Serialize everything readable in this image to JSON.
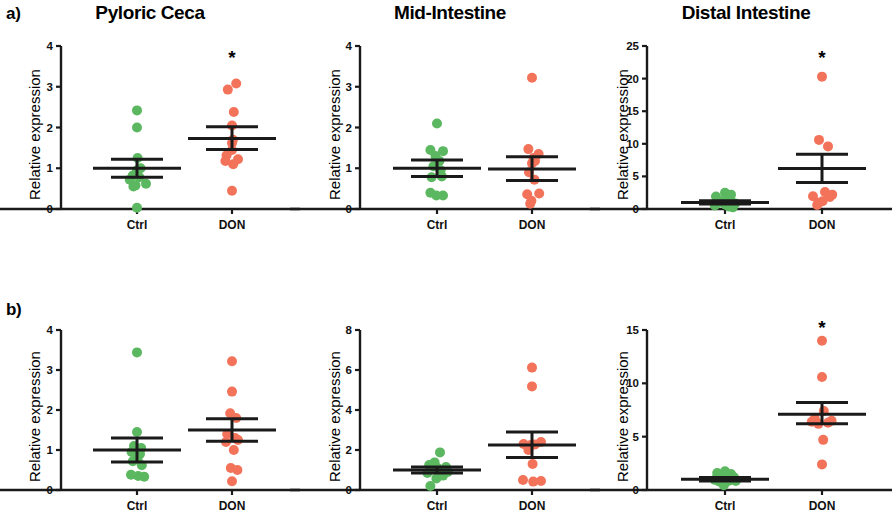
{
  "figure": {
    "width": 892,
    "height": 520,
    "panel_labels": [
      {
        "id": "a",
        "text": "a)"
      },
      {
        "id": "b",
        "text": "b)"
      }
    ],
    "axis_label": "Relative expression",
    "group_labels": [
      "Ctrl",
      "DON"
    ],
    "colors": {
      "ctrl": "#5cb860",
      "don": "#f2735a",
      "axis": "#1a1a1a",
      "text": "#000000"
    },
    "significance_marker": "✱"
  },
  "chart_data": [
    {
      "id": "a-pyloric-ceca",
      "type": "scatter",
      "row": "a",
      "title": "Pyloric Ceca",
      "xlabel": "",
      "ylabel": "Relative expression",
      "ylim": [
        0,
        4
      ],
      "yticks": [
        0,
        1,
        2,
        3,
        4
      ],
      "ytick_labels": [
        "0",
        "1",
        "2",
        "3",
        "4"
      ],
      "grid": false,
      "categories": [
        "Ctrl",
        "DON"
      ],
      "significance": {
        "group": "DON",
        "marker": "*",
        "y": 3.55
      },
      "series": [
        {
          "name": "Ctrl",
          "color": "#5cb860",
          "mean": 1.0,
          "sem_upper": 1.22,
          "sem_lower": 0.78,
          "values": [
            2.42,
            2.0,
            1.25,
            1.0,
            0.95,
            0.82,
            0.78,
            0.72,
            0.62,
            0.58,
            0.55,
            0.03
          ],
          "jitter": [
            0.0,
            0.0,
            0.02,
            0.12,
            0.0,
            -0.14,
            0.08,
            -0.24,
            0.3,
            -0.05,
            -0.12,
            0.0
          ]
        },
        {
          "name": "DON",
          "color": "#f2735a",
          "mean": 1.73,
          "sem_upper": 2.02,
          "sem_lower": 1.46,
          "values": [
            3.08,
            2.93,
            2.38,
            2.05,
            1.7,
            1.62,
            1.45,
            1.32,
            1.22,
            1.18,
            1.1,
            0.45
          ],
          "jitter": [
            0.14,
            -0.14,
            0.06,
            0.0,
            0.03,
            0.0,
            0.0,
            -0.18,
            0.2,
            -0.22,
            0.04,
            0.0
          ]
        }
      ]
    },
    {
      "id": "a-mid-intestine",
      "type": "scatter",
      "row": "a",
      "title": "Mid-Intestine",
      "xlabel": "",
      "ylabel": "Relative expression",
      "ylim": [
        0,
        4
      ],
      "yticks": [
        0,
        1,
        2,
        3,
        4
      ],
      "ytick_labels": [
        "0",
        "1",
        "2",
        "3",
        "4"
      ],
      "grid": false,
      "categories": [
        "Ctrl",
        "DON"
      ],
      "significance": null,
      "series": [
        {
          "name": "Ctrl",
          "color": "#5cb860",
          "mean": 1.0,
          "sem_upper": 1.2,
          "sem_lower": 0.8,
          "values": [
            2.1,
            1.45,
            1.42,
            1.3,
            1.18,
            1.05,
            0.95,
            0.8,
            0.78,
            0.4,
            0.33,
            0.33
          ],
          "jitter": [
            0.0,
            -0.22,
            0.2,
            -0.05,
            0.08,
            -0.12,
            0.12,
            0.16,
            -0.18,
            -0.22,
            -0.02,
            0.2
          ]
        },
        {
          "name": "DON",
          "color": "#f2735a",
          "mean": 0.98,
          "sem_upper": 1.28,
          "sem_lower": 0.7,
          "values": [
            3.22,
            1.47,
            1.35,
            1.25,
            1.18,
            1.12,
            0.9,
            0.72,
            0.38,
            0.36,
            0.2,
            0.13
          ],
          "jitter": [
            0.0,
            -0.12,
            0.22,
            0.05,
            0.1,
            0.0,
            -0.1,
            0.08,
            0.24,
            -0.16,
            -0.02,
            -0.06
          ]
        }
      ]
    },
    {
      "id": "a-distal-intestine",
      "type": "scatter",
      "row": "a",
      "title": "Distal Intestine",
      "xlabel": "",
      "ylabel": "Relative expression",
      "ylim": [
        0,
        25
      ],
      "yticks": [
        0,
        5,
        10,
        15,
        20,
        25
      ],
      "ytick_labels": [
        "0",
        "5",
        "10",
        "15",
        "20",
        "25"
      ],
      "grid": false,
      "categories": [
        "Ctrl",
        "DON"
      ],
      "significance": {
        "group": "DON",
        "marker": "*",
        "y": 22.3
      },
      "series": [
        {
          "name": "Ctrl",
          "color": "#5cb860",
          "mean": 1.0,
          "sem_upper": 1.25,
          "sem_lower": 0.78,
          "values": [
            2.5,
            2.2,
            1.9,
            1.35,
            1.2,
            1.05,
            0.95,
            0.85,
            0.7,
            0.55,
            0.4,
            0.25
          ],
          "jitter": [
            0.0,
            0.2,
            -0.3,
            0.08,
            -0.14,
            0.22,
            -0.22,
            0.34,
            0.0,
            -0.34,
            0.12,
            0.26
          ]
        },
        {
          "name": "DON",
          "color": "#f2735a",
          "mean": 6.2,
          "sem_upper": 8.4,
          "sem_lower": 4.05,
          "values": [
            20.3,
            10.6,
            9.6,
            2.6,
            2.2,
            1.95,
            1.85,
            1.2,
            0.95,
            0.6
          ],
          "jitter": [
            0.0,
            -0.1,
            0.2,
            0.1,
            0.34,
            -0.3,
            0.26,
            0.02,
            -0.12,
            -0.16
          ]
        }
      ]
    },
    {
      "id": "b-pyloric-ceca",
      "type": "scatter",
      "row": "b",
      "title": "",
      "xlabel": "",
      "ylabel": "Relative expression",
      "ylim": [
        0,
        4
      ],
      "yticks": [
        0,
        1,
        2,
        3,
        4
      ],
      "ytick_labels": [
        "0",
        "1",
        "2",
        "3",
        "4"
      ],
      "grid": false,
      "categories": [
        "Ctrl",
        "DON"
      ],
      "significance": null,
      "series": [
        {
          "name": "Ctrl",
          "color": "#5cb860",
          "mean": 1.0,
          "sem_upper": 1.3,
          "sem_lower": 0.7,
          "values": [
            3.44,
            1.45,
            1.1,
            1.05,
            0.95,
            0.9,
            0.78,
            0.72,
            0.62,
            0.38,
            0.35,
            0.33
          ],
          "jitter": [
            0.0,
            0.0,
            -0.1,
            0.14,
            -0.18,
            0.1,
            0.02,
            -0.14,
            0.16,
            -0.2,
            0.04,
            0.24
          ]
        },
        {
          "name": "DON",
          "color": "#f2735a",
          "mean": 1.5,
          "sem_upper": 1.78,
          "sem_lower": 1.22,
          "values": [
            3.22,
            2.46,
            1.92,
            1.8,
            1.4,
            1.3,
            1.25,
            1.2,
            1.0,
            0.55,
            0.5,
            0.22
          ],
          "jitter": [
            0.0,
            0.0,
            -0.06,
            0.14,
            -0.16,
            0.1,
            0.2,
            -0.2,
            0.06,
            -0.04,
            0.18,
            0.0
          ]
        }
      ]
    },
    {
      "id": "b-mid-intestine",
      "type": "scatter",
      "row": "b",
      "title": "",
      "xlabel": "",
      "ylabel": "Relative expression",
      "ylim": [
        0,
        8
      ],
      "yticks": [
        0,
        2,
        4,
        6,
        8
      ],
      "ytick_labels": [
        "0",
        "2",
        "4",
        "6",
        "8"
      ],
      "grid": false,
      "categories": [
        "Ctrl",
        "DON"
      ],
      "significance": null,
      "series": [
        {
          "name": "Ctrl",
          "color": "#5cb860",
          "mean": 1.0,
          "sem_upper": 1.15,
          "sem_lower": 0.85,
          "values": [
            1.88,
            1.38,
            1.25,
            1.15,
            1.1,
            1.05,
            0.95,
            0.9,
            0.85,
            0.72,
            0.58,
            0.2
          ],
          "jitter": [
            0.1,
            -0.08,
            -0.26,
            0.3,
            0.02,
            -0.18,
            0.14,
            0.36,
            -0.32,
            0.2,
            -0.02,
            -0.22
          ]
        },
        {
          "name": "DON",
          "color": "#f2735a",
          "mean": 2.25,
          "sem_upper": 2.9,
          "sem_lower": 1.62,
          "values": [
            6.12,
            5.18,
            2.4,
            2.3,
            2.28,
            2.25,
            2.0,
            1.3,
            0.5,
            0.45,
            0.42
          ],
          "jitter": [
            0.0,
            0.0,
            0.3,
            -0.28,
            0.1,
            -0.04,
            -0.12,
            0.02,
            -0.3,
            0.3,
            0.04
          ]
        }
      ]
    },
    {
      "id": "b-distal-intestine",
      "type": "scatter",
      "row": "b",
      "title": "",
      "xlabel": "",
      "ylabel": "Relative expression",
      "ylim": [
        0,
        15
      ],
      "yticks": [
        0,
        5,
        10,
        15
      ],
      "ytick_labels": [
        "0",
        "5",
        "10",
        "15"
      ],
      "grid": false,
      "categories": [
        "Ctrl",
        "DON"
      ],
      "significance": {
        "group": "DON",
        "marker": "*",
        "y": 14.6
      },
      "series": [
        {
          "name": "Ctrl",
          "color": "#5cb860",
          "mean": 1.0,
          "sem_upper": 1.18,
          "sem_lower": 0.84,
          "values": [
            1.75,
            1.6,
            1.5,
            1.2,
            1.1,
            1.05,
            0.95,
            0.9,
            0.85,
            0.8,
            0.7,
            0.45
          ],
          "jitter": [
            0.0,
            -0.26,
            0.2,
            0.3,
            -0.12,
            0.08,
            -0.34,
            0.16,
            0.36,
            -0.2,
            0.02,
            -0.04
          ]
        },
        {
          "name": "DON",
          "color": "#f2735a",
          "mean": 7.1,
          "sem_upper": 8.2,
          "sem_lower": 6.2,
          "values": [
            14.0,
            10.6,
            7.4,
            6.7,
            6.5,
            6.4,
            6.3,
            6.2,
            4.7,
            2.4
          ],
          "jitter": [
            0.0,
            0.0,
            0.06,
            -0.24,
            0.32,
            -0.34,
            0.2,
            -0.12,
            0.04,
            0.0
          ]
        }
      ]
    }
  ]
}
